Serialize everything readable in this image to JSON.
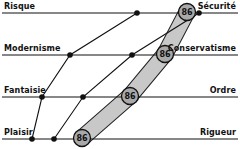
{
  "diagram": {
    "axes": [
      {
        "left_label": "Risque",
        "right_label": "Sécurité",
        "y": 13
      },
      {
        "left_label": "Modernisme",
        "right_label": "Conservatisme",
        "y": 55
      },
      {
        "left_label": "Fantaisie",
        "right_label": "Ordre",
        "y": 97
      },
      {
        "left_label": "Plaisir",
        "right_label": "Rigueur",
        "y": 139
      }
    ],
    "paths": [
      {
        "name": "path-1",
        "points": [
          [
            32,
            139
          ],
          [
            42,
            97
          ],
          [
            70,
            55
          ],
          [
            137,
            13
          ]
        ]
      },
      {
        "name": "path-2",
        "points": [
          [
            54,
            139
          ],
          [
            83,
            97
          ],
          [
            132,
            55
          ],
          [
            199,
            13
          ]
        ]
      }
    ],
    "highlight_path": {
      "label": "86",
      "points": [
        [
          82,
          138
        ],
        [
          130,
          96
        ],
        [
          165,
          54
        ],
        [
          187,
          12
        ]
      ],
      "fill_color": "#c8c8c8",
      "badge_fill": "#a9a9a9"
    },
    "badges": [
      {
        "label": "86",
        "axis": "Sécurité"
      },
      {
        "label": "86",
        "axis": "Conservatisme"
      },
      {
        "label": "86",
        "axis": "Ordre"
      },
      {
        "label": "86",
        "axis": "Rigueur"
      }
    ]
  }
}
